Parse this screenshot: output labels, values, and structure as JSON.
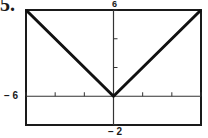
{
  "problem_number": "5.",
  "labels": {
    "ymax": "6",
    "xmin": "− 6",
    "ymin": "− 2"
  },
  "colors": {
    "frame": "#1a1a1a",
    "axes": "#333333",
    "graph": "#111111",
    "background": "#ffffff"
  },
  "chart_data": {
    "type": "line",
    "title": "",
    "xlabel": "",
    "ylabel": "",
    "xlim": [
      -6,
      6
    ],
    "ylim": [
      -2,
      6
    ],
    "xscale": 2,
    "yscale": 2,
    "x_ticks": [
      -6,
      -4,
      -2,
      2,
      4,
      6
    ],
    "y_ticks": [
      2,
      4,
      6
    ],
    "grid": false,
    "legend": null,
    "viewing_window_labels": {
      "xmin": "-6",
      "ymax": "6",
      "ymin": "-2"
    },
    "series": [
      {
        "name": "y = |x|",
        "x": [
          -6,
          0,
          6
        ],
        "y": [
          6,
          0,
          6
        ]
      }
    ]
  }
}
